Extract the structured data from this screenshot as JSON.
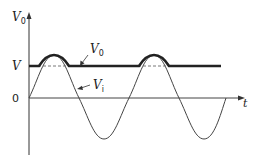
{
  "diagram": {
    "type": "waveform",
    "axes": {
      "y_label": "V",
      "y_label_sub": "0",
      "x_label": "t",
      "y_ticks": [
        {
          "label": "V",
          "level": "clip"
        },
        {
          "label": "0",
          "level": "zero"
        }
      ]
    },
    "curves": [
      {
        "name": "V0",
        "label": "V",
        "label_sub": "0",
        "style": "thick",
        "description": "Output: flat at V, follows input peaks above V"
      },
      {
        "name": "Vi",
        "label": "V",
        "label_sub": "i",
        "style": "thin",
        "description": "Sinusoidal input"
      }
    ],
    "annotations": [
      "dashed continuation of V level under peaks"
    ],
    "colors": {
      "ink": "#222222",
      "background": "#ffffff"
    }
  }
}
